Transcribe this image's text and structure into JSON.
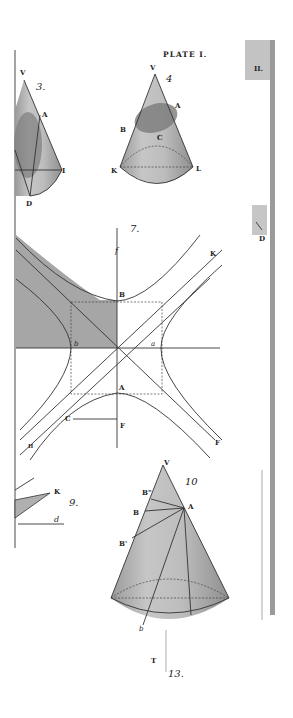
{
  "plate": {
    "title": "PLATE I.",
    "edge_labels": {
      "top": "II.",
      "mid": "D"
    }
  },
  "figures": [
    {
      "id": "fig3",
      "number": "3.",
      "labels": {
        "V": "V",
        "A": "A",
        "I": "I",
        "D": "D"
      }
    },
    {
      "id": "fig4",
      "number": "4",
      "labels": {
        "V": "V",
        "A": "A",
        "B": "B",
        "C": "C",
        "K": "K",
        "L": "L"
      }
    },
    {
      "id": "fig7",
      "number": "7.",
      "labels": {
        "f": "f",
        "K": "K",
        "B": "B",
        "b": "b",
        "a": "a",
        "A": "A",
        "C": "C",
        "F1": "F",
        "F2": "F",
        "H": "H"
      }
    },
    {
      "id": "fig9",
      "number": "9.",
      "labels": {
        "K": "K",
        "d": "d"
      }
    },
    {
      "id": "fig10",
      "number": "10",
      "labels": {
        "V": "V",
        "A": "A",
        "B2": "B\"",
        "B": "B",
        "B1": "B'",
        "b": "b"
      }
    },
    {
      "id": "fig13",
      "number": "13.",
      "labels": {
        "T": "T"
      }
    }
  ],
  "colors": {
    "paper": "#ffffff",
    "ink": "#333333",
    "shade_light": "#c8c8c8",
    "shade_mid": "#a8a8a8",
    "shade_dark": "#8a8a8a",
    "edge_strip": "#9a9a9a"
  }
}
